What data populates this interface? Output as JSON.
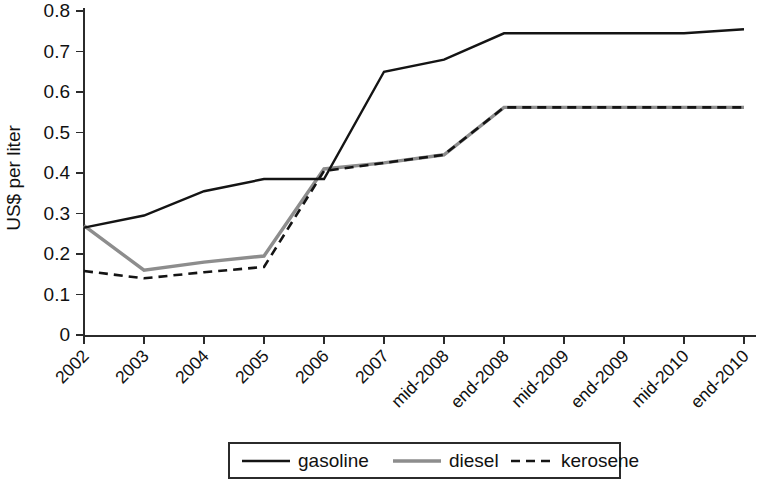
{
  "chart_data": {
    "type": "line",
    "title": "",
    "xlabel": "",
    "ylabel": "US$ per liter",
    "ylim": [
      0,
      0.8
    ],
    "ytick_labels": [
      "0",
      "0.1",
      "0.2",
      "0.3",
      "0.4",
      "0.5",
      "0.6",
      "0.7",
      "0.8"
    ],
    "ytick_values": [
      0,
      0.1,
      0.2,
      0.3,
      0.4,
      0.5,
      0.6,
      0.7,
      0.8
    ],
    "grid": false,
    "legend_position": "bottom-center",
    "categories": [
      "2002",
      "2003",
      "2004",
      "2005",
      "2006",
      "2007",
      "mid-2008",
      "end-2008",
      "mid-2009",
      "end-2009",
      "mid-2010",
      "end-2010"
    ],
    "series": [
      {
        "name": "gasoline",
        "color": "#141414",
        "style": "solid",
        "values": [
          0.265,
          0.295,
          0.355,
          0.385,
          0.385,
          0.65,
          0.68,
          0.745,
          0.745,
          0.745,
          0.745,
          0.755
        ]
      },
      {
        "name": "diesel",
        "color": "#8d8d8d",
        "style": "solid",
        "values": [
          0.27,
          0.16,
          0.18,
          0.195,
          0.41,
          0.425,
          0.445,
          0.562,
          0.562,
          0.562,
          0.562,
          0.562
        ]
      },
      {
        "name": "kerosene",
        "color": "#141414",
        "style": "dashed",
        "values": [
          0.158,
          0.14,
          0.155,
          0.168,
          0.405,
          0.425,
          0.445,
          0.562,
          0.562,
          0.562,
          0.562,
          0.562
        ]
      }
    ]
  },
  "axes": {
    "y_title": "US$ per liter"
  },
  "legend": {
    "items": [
      {
        "label": "gasoline",
        "style": "solid-dark"
      },
      {
        "label": "diesel",
        "style": "solid-gray"
      },
      {
        "label": "kerosene",
        "style": "dashed"
      }
    ]
  }
}
